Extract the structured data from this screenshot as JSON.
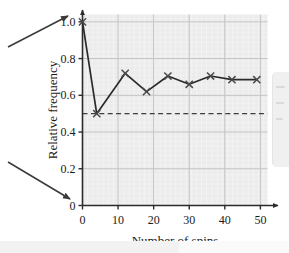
{
  "figure": {
    "name": "relative-frequency-vs-number-of-spins-graph"
  },
  "chart_data": {
    "type": "line",
    "title": "",
    "xlabel": "Number of spins",
    "ylabel": "Relative frequency",
    "xlim": [
      0,
      52
    ],
    "ylim": [
      0,
      1.04
    ],
    "grid": true,
    "legend": "none",
    "marker": "x",
    "line_color": "#2b2b2b",
    "grid_color": "#c9c9c9",
    "minor_grid_color": "#e3e3e3",
    "plot_bg": "#eeeeee",
    "x": [
      0,
      4,
      12,
      18,
      24,
      30,
      36,
      42,
      49
    ],
    "y": [
      1.0,
      0.5,
      0.72,
      0.62,
      0.705,
      0.66,
      0.705,
      0.685,
      0.685
    ],
    "xticks": [
      0,
      10,
      20,
      30,
      40,
      50
    ],
    "xtick_labels": [
      "0",
      "10",
      "20",
      "30",
      "40",
      "50"
    ],
    "yticks": [
      0,
      0.2,
      0.4,
      0.6,
      0.8,
      1.0
    ],
    "ytick_labels": [
      "0",
      "0.2",
      "0.4",
      "0.6",
      "0.8",
      "1.0"
    ],
    "reference_line": {
      "value": 0.5,
      "style": "dashed",
      "color": "#3d3d3d",
      "label": ""
    },
    "annotations": [
      {
        "name": "upper-callout-arrow",
        "points_to": "1.0",
        "direction": "up-right"
      },
      {
        "name": "lower-callout-arrow",
        "points_to": "0",
        "direction": "down-right"
      }
    ]
  }
}
